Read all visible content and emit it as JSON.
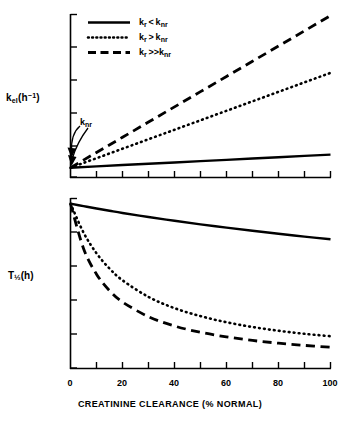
{
  "figure": {
    "xaxis_title": "CREATININE CLEARANCE (% NORMAL)",
    "top_axis_label": "k_el(h^-1)",
    "bottom_axis_label": "T1/2(h)",
    "annotation": "k_nr",
    "line_color": "#000000",
    "background": "#ffffff"
  },
  "legend": {
    "items": [
      {
        "label": "k_r < k_nr",
        "style": "solid"
      },
      {
        "label": "k_r > k_nr",
        "style": "dotted"
      },
      {
        "label": "k_r >> k_nr",
        "style": "dashed"
      }
    ]
  },
  "chart_data": {
    "type": "line",
    "title": "",
    "xlabel": "CREATININE CLEARANCE (% NORMAL)",
    "xlim": [
      0,
      100
    ],
    "xticks": [
      0,
      20,
      40,
      60,
      80,
      100
    ],
    "xticklabels": [
      "0",
      "20",
      "40",
      "60",
      "80",
      "100"
    ],
    "xminor_step": 10,
    "grid": false,
    "legend_position": "upper-left",
    "panels": [
      {
        "name": "elimination-rate-panel",
        "ylabel": "k_el(h^-1)",
        "ylim": [
          0,
          1.0
        ],
        "yticks_unlabeled": 5,
        "x": [
          0,
          10,
          20,
          30,
          40,
          50,
          60,
          70,
          80,
          90,
          100
        ],
        "series": [
          {
            "name": "k_r < k_nr",
            "style": "solid",
            "values": [
              0.06,
              0.068,
              0.076,
              0.084,
              0.092,
              0.1,
              0.108,
              0.116,
              0.124,
              0.132,
              0.14
            ]
          },
          {
            "name": "k_r > k_nr",
            "style": "dotted",
            "values": [
              0.06,
              0.118,
              0.176,
              0.234,
              0.292,
              0.35,
              0.408,
              0.466,
              0.524,
              0.582,
              0.64
            ]
          },
          {
            "name": "k_r >> k_nr",
            "style": "dashed",
            "values": [
              0.06,
              0.153,
              0.246,
              0.339,
              0.432,
              0.525,
              0.618,
              0.711,
              0.804,
              0.897,
              0.99
            ]
          }
        ]
      },
      {
        "name": "half-life-panel",
        "ylabel": "T1/2(h)",
        "ylim": [
          0,
          1.0
        ],
        "yticks_unlabeled": 4,
        "x": [
          0,
          5,
          10,
          15,
          20,
          30,
          40,
          50,
          60,
          70,
          80,
          90,
          100
        ],
        "series": [
          {
            "name": "k_r < k_nr",
            "style": "solid",
            "values": [
              0.97,
              0.955,
              0.941,
              0.928,
              0.915,
              0.891,
              0.869,
              0.848,
              0.829,
              0.81,
              0.793,
              0.776,
              0.76
            ]
          },
          {
            "name": "k_r > k_nr",
            "style": "dotted",
            "values": [
              0.97,
              0.8,
              0.678,
              0.588,
              0.519,
              0.421,
              0.355,
              0.308,
              0.272,
              0.244,
              0.222,
              0.204,
              0.19
            ]
          },
          {
            "name": "k_r >> k_nr",
            "style": "dashed",
            "values": [
              0.97,
              0.706,
              0.555,
              0.458,
              0.391,
              0.305,
              0.25,
              0.213,
              0.186,
              0.165,
              0.149,
              0.136,
              0.125
            ]
          }
        ]
      }
    ]
  }
}
